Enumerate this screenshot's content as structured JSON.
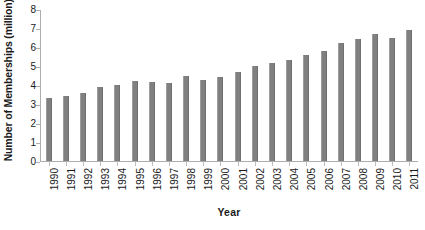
{
  "chart_data": {
    "type": "bar",
    "title": "",
    "xlabel": "Year",
    "ylabel": "Number of Memberships (million)",
    "categories": [
      "1990",
      "1991",
      "1992",
      "1993",
      "1994",
      "1995",
      "1996",
      "1997",
      "1998",
      "1999",
      "2000",
      "2001",
      "2002",
      "2003",
      "2004",
      "2005",
      "2006",
      "2007",
      "2008",
      "2009",
      "2010",
      "2011"
    ],
    "values": [
      3.3,
      3.4,
      3.6,
      3.9,
      4.0,
      4.2,
      4.15,
      4.1,
      4.5,
      4.25,
      4.4,
      4.7,
      5.0,
      5.15,
      5.3,
      5.6,
      5.8,
      6.2,
      6.4,
      6.7,
      6.5,
      6.9
    ],
    "ylim": [
      0,
      8
    ],
    "yticks": [
      0,
      1,
      2,
      3,
      4,
      5,
      6,
      7,
      8
    ],
    "ytick_labels": [
      "0",
      "1",
      "2",
      "3",
      "4",
      "5",
      "6",
      "7",
      "8"
    ],
    "grid": false,
    "legend": "none",
    "series_name": "Number of Memberships",
    "bar_color": "#808080",
    "axis_color": "#aeaeae",
    "background_color": "#ffffff"
  }
}
